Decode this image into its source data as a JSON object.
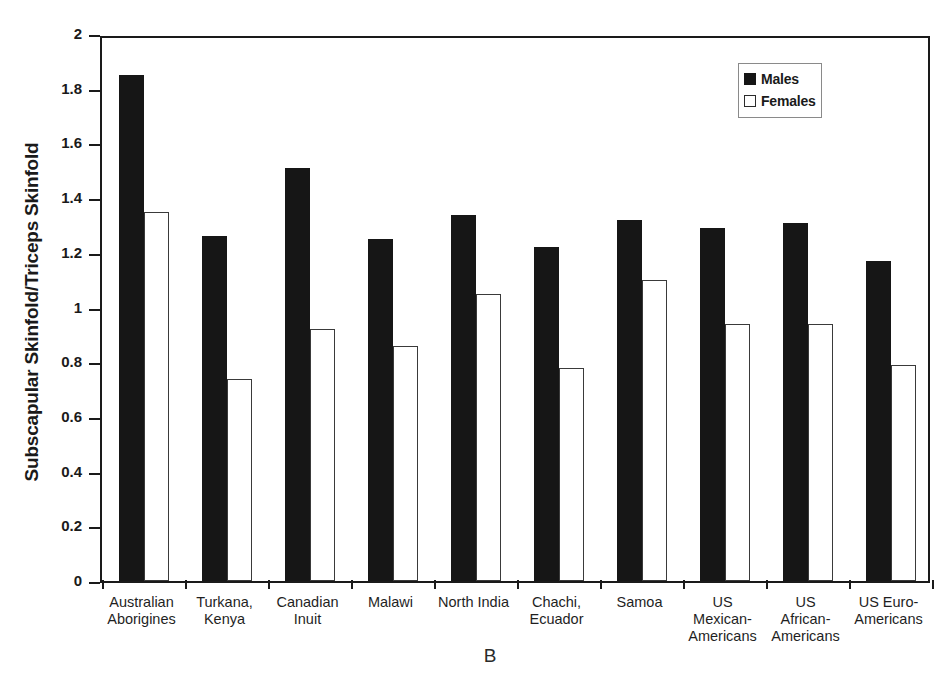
{
  "chart_data": {
    "type": "bar",
    "title": "",
    "panel_label": "B",
    "xlabel": "",
    "ylabel": "Subscapular Skinfold/Triceps Skinfold",
    "ylim": [
      0,
      2
    ],
    "ytick_step": 0.2,
    "yticks": [
      "0",
      "0.2",
      "0.4",
      "0.6",
      "0.8",
      "1",
      "1.2",
      "1.4",
      "1.6",
      "1.8",
      "2"
    ],
    "grid": false,
    "legend_position": "top-right",
    "categories": [
      "Australian\nAborigines",
      "Turkana,\nKenya",
      "Canadian\nInuit",
      "Malawi",
      "North India",
      "Chachi,\nEcuador",
      "Samoa",
      "US\nMexican-\nAmericans",
      "US\nAfrican-\nAmericans",
      "US Euro-\nAmericans"
    ],
    "category_lines": [
      [
        "Australian",
        "Aborigines"
      ],
      [
        "Turkana,",
        "Kenya"
      ],
      [
        "Canadian",
        "Inuit"
      ],
      [
        "Malawi"
      ],
      [
        "North India"
      ],
      [
        "Chachi,",
        "Ecuador"
      ],
      [
        "Samoa"
      ],
      [
        "US",
        "Mexican-",
        "Americans"
      ],
      [
        "US",
        "African-",
        "Americans"
      ],
      [
        "US Euro-",
        "Americans"
      ]
    ],
    "series": [
      {
        "name": "Males",
        "color": "#161616",
        "values": [
          1.85,
          1.26,
          1.51,
          1.25,
          1.34,
          1.22,
          1.32,
          1.29,
          1.31,
          1.17
        ]
      },
      {
        "name": "Females",
        "color": "#ffffff",
        "values": [
          1.35,
          0.74,
          0.92,
          0.86,
          1.05,
          0.78,
          1.1,
          0.94,
          0.94,
          0.79
        ]
      }
    ]
  },
  "legend": {
    "items": [
      {
        "label": "Males",
        "style": "filled"
      },
      {
        "label": "Females",
        "style": "open"
      }
    ]
  },
  "colors": {
    "male_fill": "#161616",
    "female_fill": "#ffffff",
    "axis": "#1a1a1a",
    "background": "#ffffff"
  }
}
